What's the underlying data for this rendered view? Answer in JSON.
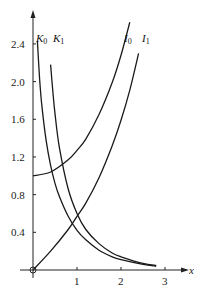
{
  "chart_data": {
    "type": "line",
    "title": "",
    "xlabel": "x",
    "ylabel": "",
    "xlim": [
      0,
      3.2
    ],
    "ylim": [
      0,
      2.6
    ],
    "x_ticks": [
      "1",
      "2",
      "3"
    ],
    "y_ticks": [
      "0.4",
      "0.8",
      "1.2",
      "1.6",
      "2.0",
      "2.4"
    ],
    "grid": false,
    "legend": "inline labels at top of curves",
    "series": [
      {
        "name": "K0",
        "label": "K₀",
        "x": [
          0.1,
          0.15,
          0.2,
          0.3,
          0.4,
          0.5,
          0.6,
          0.8,
          1.0,
          1.2,
          1.5,
          1.8,
          2.0,
          2.5,
          2.8
        ],
        "values": [
          2.43,
          2.03,
          1.75,
          1.37,
          1.11,
          0.92,
          0.78,
          0.57,
          0.42,
          0.32,
          0.21,
          0.14,
          0.11,
          0.06,
          0.04
        ]
      },
      {
        "name": "K1",
        "label": "K₁",
        "x": [
          0.4,
          0.45,
          0.5,
          0.6,
          0.8,
          1.0,
          1.2,
          1.5,
          1.8,
          2.0,
          2.5,
          2.8
        ],
        "values": [
          2.18,
          1.9,
          1.66,
          1.3,
          0.86,
          0.6,
          0.43,
          0.28,
          0.18,
          0.14,
          0.07,
          0.05
        ]
      },
      {
        "name": "I0",
        "label": "I₀",
        "x": [
          0,
          0.4,
          0.8,
          1.0,
          1.2,
          1.5,
          1.8,
          2.0,
          2.2
        ],
        "values": [
          1.0,
          1.04,
          1.17,
          1.27,
          1.39,
          1.65,
          1.99,
          2.28,
          2.63
        ]
      },
      {
        "name": "I1",
        "label": "I₁",
        "x": [
          0,
          0.4,
          0.8,
          1.0,
          1.2,
          1.5,
          1.8,
          2.0,
          2.2,
          2.4
        ],
        "values": [
          0,
          0.2,
          0.43,
          0.57,
          0.71,
          0.98,
          1.32,
          1.59,
          1.91,
          2.3
        ]
      }
    ]
  },
  "labels": {
    "x_axis": "x",
    "curves": {
      "K0": "K",
      "K0_sub": "0",
      "K1": "K",
      "K1_sub": "1",
      "I0": "I",
      "I0_sub": "0",
      "I1": "I",
      "I1_sub": "1"
    },
    "x_ticks": [
      "1",
      "2",
      "3"
    ],
    "y_ticks": [
      "0.4",
      "0.8",
      "1.2",
      "1.6",
      "2.0",
      "2.4"
    ]
  },
  "colors": {
    "line": "#1a1a1a",
    "axis": "#222222",
    "background": "#ffffff"
  }
}
